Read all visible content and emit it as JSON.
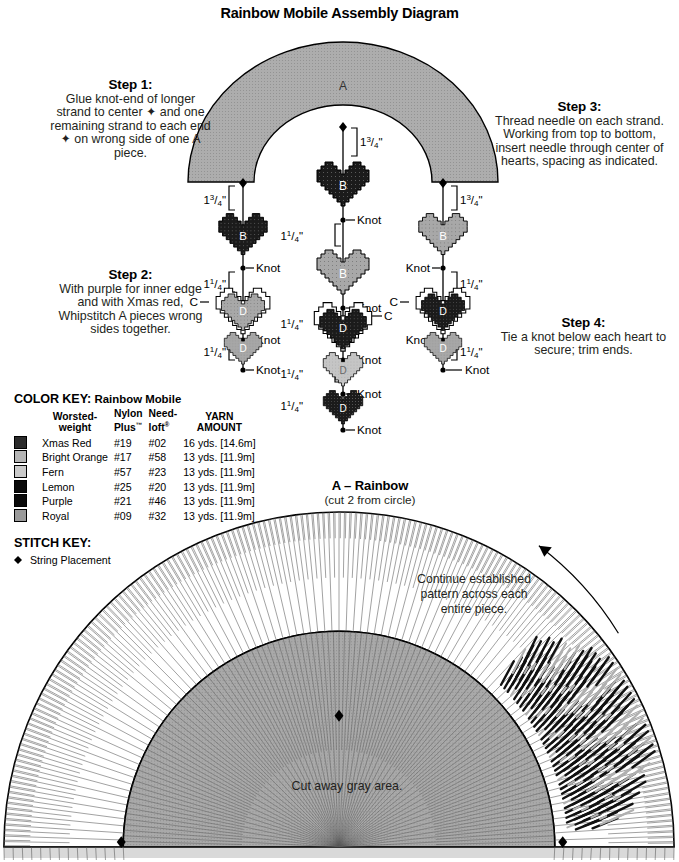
{
  "page": {
    "title": "Rainbow Mobile Assembly Diagram"
  },
  "steps": [
    {
      "id": "step1",
      "head": "Step 1:",
      "body": "Glue knot-end of longer strand to center ✦ and one remaining strand to each  end ✦ on wrong side of one A piece."
    },
    {
      "id": "step2",
      "head": "Step 2:",
      "body": "With purple for inner edge and with Xmas red, Whipstitch A pieces wrong sides together."
    },
    {
      "id": "step3",
      "head": "Step 3:",
      "body": "Thread needle on each strand. Working from top to bottom, insert needle through center of hearts, spacing as indicated."
    },
    {
      "id": "step4",
      "head": "Step 4:",
      "body": "Tie a knot below each heart to secure; trim ends."
    }
  ],
  "arch": {
    "label": "A"
  },
  "labels": {
    "knot": "Knot",
    "heart_b": "B",
    "heart_c": "C",
    "heart_d": "D",
    "dim_top_whole": "1",
    "dim_top_num": "3",
    "dim_top_den": "4",
    "dim_top_unit": "\"",
    "dim_mid_whole": "1",
    "dim_mid_num": "1",
    "dim_mid_den": "4",
    "dim_mid_unit": "\""
  },
  "strands": {
    "left": {
      "dims": [
        "1 3/4\"",
        "1 1/4\"",
        "1 1/4\""
      ],
      "hearts": [
        {
          "label": "B",
          "color": "dark"
        },
        {
          "label": "D",
          "color": "mid",
          "outline": "C"
        },
        {
          "label": "D",
          "color": "mid"
        }
      ],
      "knots": [
        "Knot",
        "Knot",
        "Knot"
      ]
    },
    "center": {
      "dims": [
        "1 3/4\"",
        "1 1/4\"",
        "1 1/4\"",
        "1 1/4\"",
        "1 1/4\""
      ],
      "hearts": [
        {
          "label": "B",
          "color": "dark"
        },
        {
          "label": "B",
          "color": "mid"
        },
        {
          "label": "D",
          "color": "dark",
          "outline": "C"
        },
        {
          "label": "D",
          "color": "light"
        },
        {
          "label": "D",
          "color": "dark"
        }
      ],
      "knots": [
        "Knot",
        "Knot",
        "Knot",
        "Knot",
        "Knot"
      ]
    },
    "right": {
      "dims": [
        "1 3/4\"",
        "1 1/4\"",
        "1 1/4\""
      ],
      "hearts": [
        {
          "label": "B",
          "color": "mid"
        },
        {
          "label": "D",
          "color": "dark",
          "outline": "C"
        },
        {
          "label": "D",
          "color": "mid"
        }
      ],
      "knots": [
        "Knot",
        "Knot",
        "Knot"
      ]
    }
  },
  "color_key": {
    "title": "COLOR KEY:",
    "subtitle": "Rainbow Mobile",
    "headers": [
      "Worsted-\nweight",
      "Nylon\nPlus™",
      "Need-\nloft®",
      "YARN\nAMOUNT"
    ],
    "header_lines": [
      [
        "Worsted-",
        "weight"
      ],
      [
        "Nylon",
        "Plus"
      ],
      [
        "Need-",
        "loft"
      ],
      [
        "YARN",
        "AMOUNT"
      ]
    ],
    "rows": [
      {
        "swatch": "#2b2b2b",
        "name": "Xmas Red",
        "nylon": "#19",
        "needloft": "#02",
        "amount": "16 yds. [14.6m]"
      },
      {
        "swatch": "#b5b5b5",
        "name": "Bright Orange",
        "nylon": "#17",
        "needloft": "#58",
        "amount": "13 yds. [11.9m]"
      },
      {
        "swatch": "#c9c9c9",
        "name": "Fern",
        "nylon": "#57",
        "needloft": "#23",
        "amount": "13 yds. [11.9m]"
      },
      {
        "swatch": "#0a0a0a",
        "name": "Lemon",
        "nylon": "#25",
        "needloft": "#20",
        "amount": "13 yds. [11.9m]"
      },
      {
        "swatch": "#0a0a0a",
        "name": "Purple",
        "nylon": "#21",
        "needloft": "#46",
        "amount": "13 yds. [11.9m]"
      },
      {
        "swatch": "#9a9a9a",
        "name": "Royal",
        "nylon": "#09",
        "needloft": "#32",
        "amount": "13 yds. [11.9m]"
      }
    ]
  },
  "stitch_key": {
    "title": "STITCH KEY:",
    "items": [
      {
        "symbol": "string-placement-diamond",
        "label": "String Placement"
      }
    ]
  },
  "chart": {
    "heading": "A – Rainbow",
    "subheading": "(cut 2 from circle)",
    "note": "Continue established pattern across each entire piece.",
    "cut_note": "Cut away gray area.",
    "arrow": "direction-arrow",
    "colors": {
      "gray_area": "#a9a9a9",
      "grid_line": "#4a4a4a",
      "outline": "#000000",
      "dark_stitch": "#111111",
      "light_stitch": "#b0b0b0"
    }
  }
}
